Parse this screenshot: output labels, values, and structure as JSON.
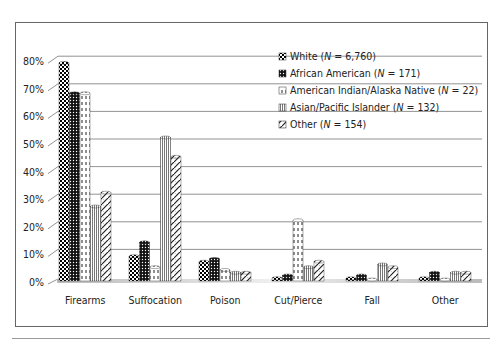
{
  "chart_data": {
    "type": "bar",
    "title": "",
    "xlabel": "",
    "ylabel": "",
    "ylim": [
      0,
      80
    ],
    "yticks": [
      "0%",
      "10%",
      "20%",
      "30%",
      "40%",
      "50%",
      "60%",
      "70%",
      "80%"
    ],
    "grid": true,
    "legend_position": "upper right (inside)",
    "categories": [
      "Firearms",
      "Suffocation",
      "Poison",
      "Cut/Pierce",
      "Fall",
      "Other"
    ],
    "series": [
      {
        "name": "White (N = 6,760)",
        "values": [
          79,
          9,
          7,
          1,
          1,
          1
        ]
      },
      {
        "name": "African American (N = 171)",
        "values": [
          68,
          14,
          8,
          2,
          2,
          3
        ]
      },
      {
        "name": "American Indian/Alaska Native (N = 22)",
        "values": [
          68,
          5,
          4,
          22,
          0,
          0
        ]
      },
      {
        "name": "Asian/Pacific Islander (N = 132)",
        "values": [
          27,
          52,
          3,
          5,
          6,
          3
        ]
      },
      {
        "name": "Other (N = 154)",
        "values": [
          32,
          45,
          3,
          7,
          5,
          3
        ]
      }
    ]
  },
  "legend": [
    {
      "label": "White (",
      "italic": "N",
      "rest": " = 6,760)"
    },
    {
      "label": "African American (",
      "italic": "N",
      "rest": " = 171)"
    },
    {
      "label": "American Indian/Alaska Native (",
      "italic": "N",
      "rest": " = 22)"
    },
    {
      "label": "Asian/Pacific Islander (",
      "italic": "N",
      "rest": " = 132)"
    },
    {
      "label": "Other (",
      "italic": "N",
      "rest": " = 154)"
    }
  ]
}
